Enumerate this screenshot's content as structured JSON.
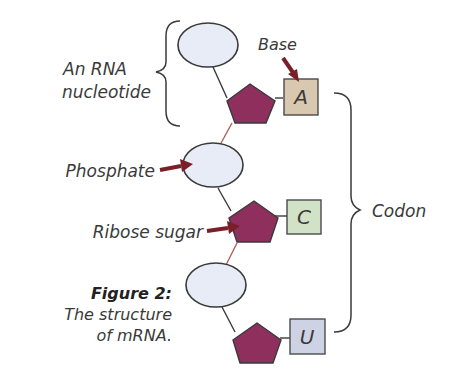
{
  "diagram": {
    "labels": {
      "nucleotide_line1": "An RNA",
      "nucleotide_line2": "nucleotide",
      "base": "Base",
      "phosphate": "Phosphate",
      "ribose_sugar": "Ribose sugar",
      "codon": "Codon"
    },
    "nucleotides": [
      {
        "base": "A",
        "base_color": "#d8c8b0"
      },
      {
        "base": "C",
        "base_color": "#d2e2c6"
      },
      {
        "base": "U",
        "base_color": "#cdd3e4"
      }
    ],
    "caption": {
      "title": "Figure 2:",
      "line1": "The structure",
      "line2": "of mRNA."
    },
    "colors": {
      "phosphate_fill": "#e8ecf6",
      "sugar_fill": "#8e2f5e",
      "arrow": "#7a1f2a"
    }
  }
}
